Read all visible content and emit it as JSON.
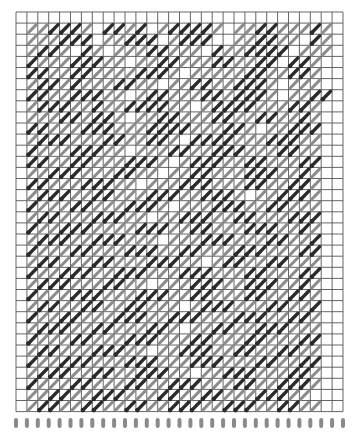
{
  "diagram": {
    "type": "weaving-draft-grid",
    "title_visible": false,
    "grid": {
      "left": 16,
      "top": 12,
      "cols": 30,
      "rows": 36,
      "cell_w": 10.9,
      "cell_h": 11.1,
      "line_color": "#555555",
      "background": "#ffffff"
    },
    "colors": {
      "dark_stroke": "#2b2b2b",
      "gray_stroke": "#8c8c8c",
      "pin": "#8a8a8a"
    },
    "legend": {
      "D": "dark diagonal thread",
      "G": "gray diagonal thread",
      ".": "empty cell"
    },
    "rows": [
      "..............................",
      ".GGDDDG.DDGD.GDDDDG.GGDDGGGDG.",
      ".GGGDDD.GGDDD.GDDD..GGDDGG.DG.",
      ".GDDG.DG.GGGDDGGG.DGGDDDD.GGG.",
      ".DGGGDDDGG.GGDDGGGDDGGDD.DDG..",
      ".DDGGDDGGGGDDDG.GGGGGDDGGDDG..",
      ".GDDGDGGGDDGG.GGDDGGDDDG.GGG..",
      ".DDGGDDDGG.GDDGGGDDGDDDG.GGDD.",
      ".GDDDGGDGGDDDDGG.GDDDDGGGDDG..",
      ".GGGDDGDDG.GGDDGGGDDGGDDGGDG..",
      ".DDGGGDDDGGGDDDDGGGDDG.GGDDD..",
      ".GDDDGGGDDGGDDG.DDDDGGGDDDGG..",
      ".DGGGDDDGG.GGGDDGGDDDGGGDDGG..",
      ".DDGGDDGGGDDDG.GDDDGGDDGGGDD..",
      ".GGDDDGGGDDGG.GGDDGGGDDDGGDG..",
      ".DDGGGDDDGG.GGGDDDGGGDDGGDDG..",
      ".GDDDGGDDGGGDDDGGDDDG.GGDDDG..",
      ".DGGGDDGGGDDDG.GGGDDDGGDDGGG..",
      ".GDDGGGDDDGG.GGDDDGGDDGGGDDD..",
      ".DGGDDDGGGGDDDGGDDGGGDDDGGDG..",
      ".GDDDGGDDDGGG.GGGDDDGGGDDGGD..",
      ".DGGGDDGGGDDDGGDDGGGDDDGGGDD..",
      ".GDDGGGDDGGGDDDGG.GDDGGDDGGG..",
      ".DGGDDDGGDDDGGGDDDGGGDDGGGDD..",
      ".GDDDGGGDDGG.GGGDDDGGDDDGGDG..",
      ".DGGGDDDGGGDDDGGDDGGGDDGGDDG..",
      ".GDDGGDDGGDDGGG.GDDDGGGDDGGD..",
      ".DGGDDGGGDDDGGDDDGGGDDDGGDDG..",
      ".GDDDGGDDGGGDDG.GGDDGGDDDGGG..",
      ".DGGGDDGGGDDDGGGDDGGGDDGGGDD..",
      ".GDDGGGDDDGG.GGDDDGGDDGGDDGG..",
      ".DGGDDDGGGDDDGGGDDDGGGDDGGDD..",
      ".GDDDGGDDGGDDDGG.GGDDDGGGDDG..",
      ".DGGGDDGGGDDGGDDDGGGDDGGDDDG..",
      ".GGDDGGDDDGGGDDGGDDGGGDDDGG...",
      ".GDDGGDDGGDDGGDDDGGDDDGGDDGG.."
    ],
    "pins": {
      "count": 31,
      "y_top": 418,
      "y_bottom": 428,
      "width": 4
    }
  }
}
